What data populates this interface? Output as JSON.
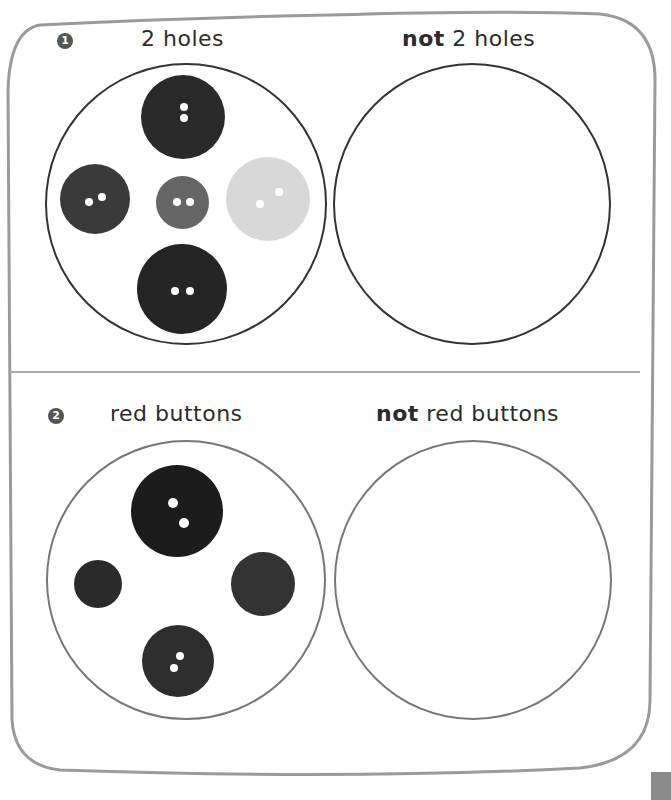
{
  "exercises": [
    {
      "number": "1",
      "left_label": "2 holes",
      "right_label_bold": "not",
      "right_label_rest": " 2 holes",
      "left_buttons": 5,
      "right_buttons": 0
    },
    {
      "number": "2",
      "left_label": "red buttons",
      "right_label_bold": "not",
      "right_label_rest": " red buttons",
      "left_buttons": 4,
      "right_buttons": 0
    }
  ]
}
